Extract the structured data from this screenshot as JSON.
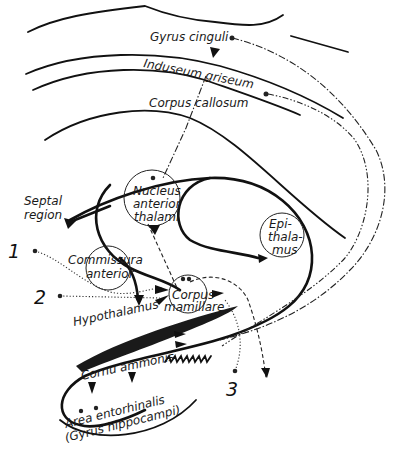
{
  "diagram": {
    "type": "anatomical pathway diagram (limbic system / Papez circuit)",
    "labels": {
      "gyrus_cinguli": "Gyrus cinguli",
      "induseum_griseum": "Induseum griseum",
      "corpus_callosum": "Corpus callosum",
      "septal_region_line1": "Septal",
      "septal_region_line2": "region",
      "nucleus_line1": "Nucleus",
      "nucleus_line2": "anterior",
      "nucleus_line3": "thalami",
      "epithalamus_line1": "Epi-",
      "epithalamus_line2": "thala-",
      "epithalamus_line3": "mus",
      "commissura_line1": "Commissura",
      "commissura_line2": "anterior",
      "corpus_mamillare_line1": "Corpus",
      "corpus_mamillare_line2": "mamillare",
      "hypothalamus": "Hypothalamus",
      "cornu_ammonis": "Cornu ammonis",
      "area_entorhinalis": "Area entorhinalis",
      "gyrus_hippocampi": "(Gyrus hippocampi)"
    },
    "numbered_markers": [
      "1",
      "2",
      "3"
    ],
    "colors": {
      "ink": "#111111",
      "background": "#ffffff"
    }
  }
}
